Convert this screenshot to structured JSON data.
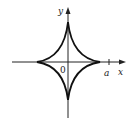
{
  "diagram": {
    "type": "astroid-curve",
    "labels": {
      "y_axis": "y",
      "x_axis": "x",
      "origin": "0",
      "a": "a"
    },
    "colors": {
      "curve": "#111111",
      "axes": "#222222",
      "background": "#ffffff"
    }
  }
}
